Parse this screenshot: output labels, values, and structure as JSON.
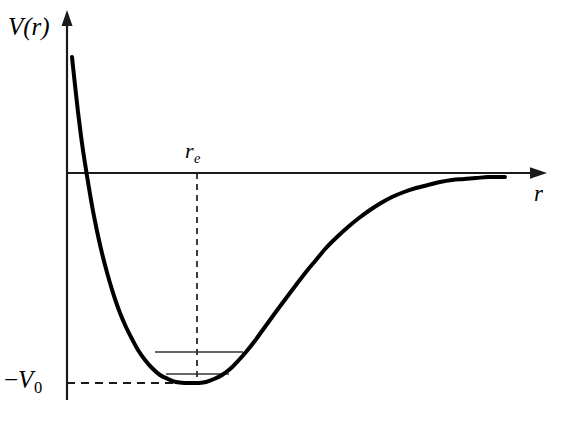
{
  "figure": {
    "background_color": "#ffffff",
    "stroke_color": "#000000",
    "axis_color": "#1a1a1a",
    "level_color": "#333333",
    "width": 562,
    "height": 421
  },
  "labels": {
    "y_axis": "V(r)",
    "x_axis": "r",
    "equilibrium": "r",
    "equilibrium_sub": "e",
    "well_depth_sign": "−",
    "well_depth": "V",
    "well_depth_sub": "0"
  },
  "chart_data": {
    "type": "line",
    "xlabel": "r",
    "ylabel": "V(r)",
    "grid": false,
    "legend": null,
    "axis_origin_px": {
      "x": 67,
      "y": 173
    },
    "xlim_px": [
      67,
      545
    ],
    "ylim_px": [
      12,
      400
    ],
    "annotations": [
      {
        "name": "equilibrium-distance",
        "label": "r_e",
        "type": "vertical-dashed-line",
        "x_px": 197,
        "y_from_px": 173,
        "y_to_px": 383
      },
      {
        "name": "well-depth",
        "label": "-V_0",
        "type": "horizontal-dashed-line",
        "y_px": 383,
        "x_from_px": 67,
        "x_to_px": 199
      }
    ],
    "energy_levels": [
      {
        "name": "upper-level",
        "y_px": 352,
        "x_from_px": 155,
        "x_to_px": 243
      },
      {
        "name": "lower-level",
        "y_px": 374,
        "x_from_px": 166,
        "x_to_px": 229
      }
    ],
    "curve_points_px": [
      [
        72,
        57
      ],
      [
        75,
        85
      ],
      [
        78,
        112
      ],
      [
        81,
        136
      ],
      [
        84,
        157
      ],
      [
        87,
        176
      ],
      [
        90,
        194
      ],
      [
        93,
        211
      ],
      [
        97,
        231
      ],
      [
        101,
        249
      ],
      [
        105,
        265
      ],
      [
        110,
        283
      ],
      [
        115,
        299
      ],
      [
        120,
        313
      ],
      [
        126,
        327
      ],
      [
        132,
        339
      ],
      [
        138,
        350
      ],
      [
        145,
        360
      ],
      [
        152,
        368
      ],
      [
        160,
        375
      ],
      [
        168,
        379
      ],
      [
        176,
        382
      ],
      [
        185,
        383
      ],
      [
        194,
        383
      ],
      [
        198,
        383
      ],
      [
        206,
        382
      ],
      [
        214,
        379
      ],
      [
        222,
        375
      ],
      [
        230,
        369
      ],
      [
        238,
        361
      ],
      [
        246,
        352
      ],
      [
        254,
        342
      ],
      [
        262,
        331
      ],
      [
        270,
        320
      ],
      [
        278,
        309
      ],
      [
        287,
        297
      ],
      [
        296,
        285
      ],
      [
        306,
        272
      ],
      [
        316,
        260
      ],
      [
        326,
        248
      ],
      [
        337,
        237
      ],
      [
        348,
        227
      ],
      [
        359,
        218
      ],
      [
        370,
        210
      ],
      [
        381,
        203
      ],
      [
        392,
        197
      ],
      [
        404,
        192
      ],
      [
        416,
        188
      ],
      [
        428,
        185
      ],
      [
        440,
        182
      ],
      [
        452,
        180
      ],
      [
        464,
        179
      ],
      [
        476,
        178
      ],
      [
        488,
        177
      ],
      [
        497,
        177
      ],
      [
        505,
        177
      ]
    ]
  }
}
